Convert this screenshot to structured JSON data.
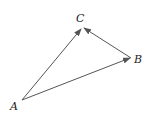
{
  "diagram": {
    "type": "vector-triangle",
    "points": {
      "A": {
        "label": "A",
        "x": 22,
        "y": 100,
        "label_x": 10,
        "label_y": 110
      },
      "B": {
        "label": "B",
        "x": 131,
        "y": 58,
        "label_x": 134,
        "label_y": 63
      },
      "C": {
        "label": "C",
        "x": 82,
        "y": 28,
        "label_x": 76,
        "label_y": 22
      }
    },
    "arrows": [
      {
        "from": "A",
        "to": "C"
      },
      {
        "from": "A",
        "to": "B"
      },
      {
        "from": "B",
        "to": "C"
      }
    ],
    "colors": {
      "line": "#555555",
      "text": "#222222",
      "background": "#ffffff"
    }
  }
}
